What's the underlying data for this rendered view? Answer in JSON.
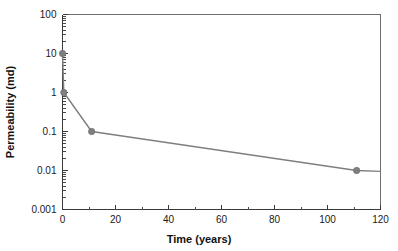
{
  "chart_data": {
    "type": "line",
    "title": "",
    "xlabel": "Time (years)",
    "ylabel": "Permeability (md)",
    "xscale": "linear",
    "yscale": "log",
    "xlim": [
      0,
      120
    ],
    "ylim": [
      0.001,
      100
    ],
    "grid": false,
    "legend": null,
    "x_major_ticks": [
      0,
      20,
      40,
      60,
      80,
      100,
      120
    ],
    "x_major_tick_labels": [
      "0",
      "20",
      "40",
      "60",
      "80",
      "100",
      "120"
    ],
    "x_minor_ticks": [
      10,
      30,
      50,
      70,
      90,
      110
    ],
    "y_major_ticks": [
      100,
      10,
      1,
      0.1,
      0.01,
      0.001
    ],
    "y_major_tick_labels": [
      "100",
      "10",
      "1",
      "0.1",
      "0.01",
      "0.001"
    ],
    "series": [
      {
        "name": "Permeability",
        "color": "#7f7f7f",
        "marker": "circle",
        "x": [
          0,
          0.5,
          11,
          111,
          120
        ],
        "y": [
          10,
          1,
          0.1,
          0.01,
          0.0095
        ],
        "marker_at": [
          true,
          true,
          true,
          true,
          false
        ]
      }
    ]
  },
  "axes": {
    "x_title": "Time (years)",
    "y_title": "Permeability (md)"
  }
}
